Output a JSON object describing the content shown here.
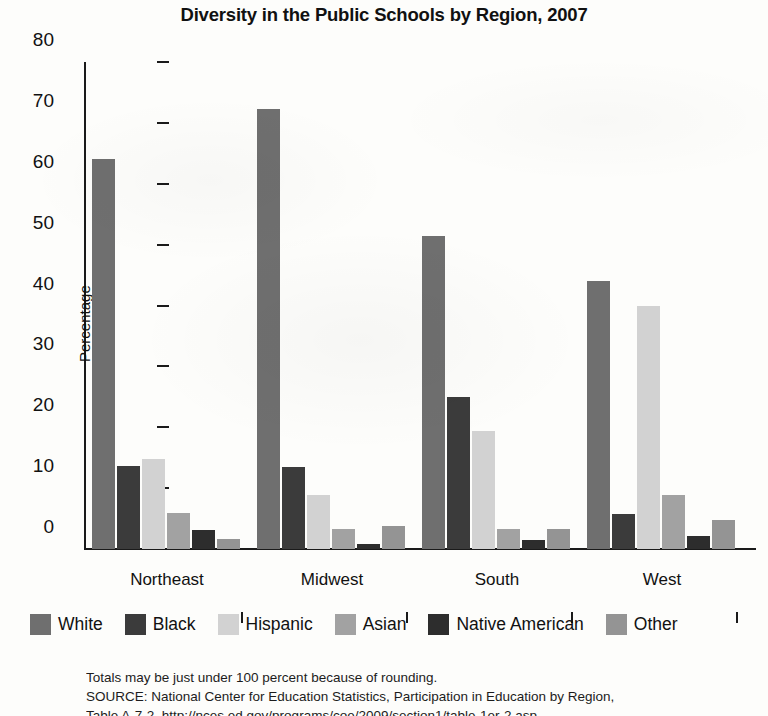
{
  "chart_data": {
    "type": "bar",
    "title": "Diversity in the Public Schools by Region, 2007",
    "xlabel": "",
    "ylabel": "Percentage",
    "ylim": [
      0,
      80
    ],
    "ytick_step": 10,
    "yticks": [
      0,
      10,
      20,
      30,
      40,
      50,
      60,
      70,
      80
    ],
    "grid": false,
    "legend_position": "bottom",
    "categories": [
      "Northeast",
      "Midwest",
      "South",
      "West"
    ],
    "series": [
      {
        "name": "White",
        "color": "#6f6f6f",
        "values": [
          64.0,
          72.2,
          51.5,
          44.0
        ]
      },
      {
        "name": "Black",
        "color": "#3b3b3b",
        "values": [
          13.7,
          13.4,
          24.9,
          5.8
        ]
      },
      {
        "name": "Hispanic",
        "color": "#d2d2d2",
        "values": [
          14.8,
          8.9,
          19.4,
          40.0
        ]
      },
      {
        "name": "Asian",
        "color": "#a2a2a2",
        "values": [
          5.9,
          3.3,
          3.3,
          8.8
        ]
      },
      {
        "name": "Native American",
        "color": "#2d2d2d",
        "values": [
          3.1,
          0.8,
          1.4,
          2.2
        ]
      },
      {
        "name": "Other",
        "color": "#949494",
        "values": [
          1.6,
          3.7,
          3.3,
          4.8
        ]
      }
    ]
  },
  "notes": {
    "line1": "Totals may be just under 100 percent because of rounding.",
    "line2": "SOURCE: National Center for Education Statistics, Participation in Education by Region,",
    "line3": "Table A-7-2, http://nces.ed.gov/programs/coe/2009/section1/table-1er-2.asp"
  }
}
